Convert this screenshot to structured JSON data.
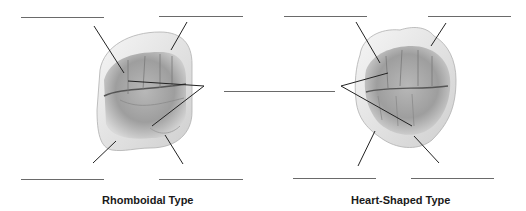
{
  "figures": [
    {
      "id": "rhomboidal",
      "caption": "Rhomboidal Type",
      "blanks": [
        {
          "position": "top-left",
          "value": ""
        },
        {
          "position": "top-right",
          "value": ""
        },
        {
          "position": "middle-right",
          "value": ""
        },
        {
          "position": "bottom-left",
          "value": ""
        },
        {
          "position": "bottom-right",
          "value": ""
        }
      ]
    },
    {
      "id": "heart-shaped",
      "caption": "Heart-Shaped Type",
      "blanks": [
        {
          "position": "top-left",
          "value": ""
        },
        {
          "position": "top-right",
          "value": ""
        },
        {
          "position": "middle-left",
          "value": ""
        },
        {
          "position": "bottom-left",
          "value": ""
        },
        {
          "position": "bottom-right",
          "value": ""
        }
      ]
    }
  ],
  "colors": {
    "line": "#222222",
    "blank_line": "#6a6a6a",
    "tooth_light": "#f4f4f4",
    "tooth_mid": "#c8c8c8",
    "tooth_dark": "#8a8a8a"
  }
}
